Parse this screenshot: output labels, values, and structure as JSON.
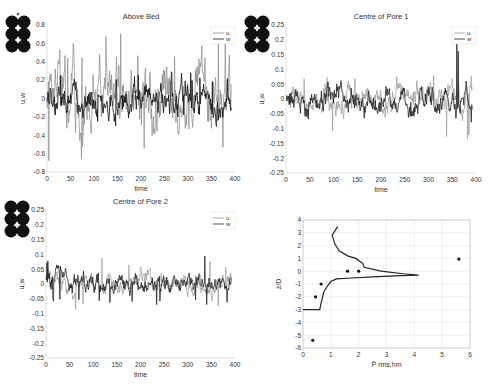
{
  "chart_data": [
    {
      "type": "line",
      "title": "Above Bed",
      "xlabel": "time",
      "ylabel": "u,w",
      "xlim": [
        0,
        400
      ],
      "ylim": [
        -0.8,
        0.8
      ],
      "xticks": [
        0,
        50,
        100,
        150,
        200,
        250,
        300,
        350,
        400
      ],
      "yticks": [
        -0.8,
        -0.6,
        -0.4,
        -0.2,
        0,
        0.2,
        0.4,
        0.6,
        0.8
      ],
      "legend": [
        "u",
        "w"
      ],
      "legend_position": "upper right",
      "series": [
        {
          "name": "u",
          "color": "#888888",
          "amplitude": 0.35,
          "peak": 0.72,
          "trough": -0.76,
          "seed": 3
        },
        {
          "name": "w",
          "color": "#111111",
          "amplitude": 0.15,
          "peak": 0.3,
          "trough": -0.25,
          "seed": 7
        }
      ],
      "inset_marker": "top"
    },
    {
      "type": "line",
      "title": "Centre of Pore 1",
      "xlabel": "time",
      "ylabel": "u,w",
      "xlim": [
        0,
        400
      ],
      "ylim": [
        -0.25,
        0.25
      ],
      "xticks": [
        0,
        50,
        100,
        150,
        200,
        250,
        300,
        350,
        400
      ],
      "yticks": [
        -0.25,
        -0.2,
        -0.15,
        -0.1,
        -0.05,
        0,
        0.05,
        0.1,
        0.15,
        0.2,
        0.25
      ],
      "legend": [
        "u",
        "w"
      ],
      "legend_position": "upper right",
      "series": [
        {
          "name": "u",
          "color": "#999999",
          "amplitude": 0.04,
          "peak": 0.08,
          "trough": -0.15,
          "seed": 11
        },
        {
          "name": "w",
          "color": "#222222",
          "amplitude": 0.04,
          "peak": 0.25,
          "trough": -0.08,
          "seed": 19
        }
      ],
      "inset_marker": "centre-1"
    },
    {
      "type": "line",
      "title": "Centre of Pore 2",
      "xlabel": "time",
      "ylabel": "u,w",
      "xlim": [
        0,
        400
      ],
      "ylim": [
        -0.25,
        0.25
      ],
      "xticks": [
        0,
        50,
        100,
        150,
        200,
        250,
        300,
        350,
        400
      ],
      "yticks": [
        -0.25,
        -0.2,
        -0.15,
        -0.1,
        -0.05,
        0,
        0.05,
        0.1,
        0.15,
        0.2,
        0.25
      ],
      "legend": [
        "u",
        "w"
      ],
      "legend_position": "upper right",
      "series": [
        {
          "name": "u",
          "color": "#999999",
          "amplitude": 0.03,
          "peak": 0.09,
          "trough": -0.09,
          "seed": 23
        },
        {
          "name": "w",
          "color": "#222222",
          "amplitude": 0.03,
          "peak": 0.11,
          "trough": -0.07,
          "seed": 29
        }
      ],
      "inset_marker": "centre-2"
    },
    {
      "type": "line+scatter",
      "title": "",
      "xlabel": "P̄ rms,hm",
      "ylabel": "z/D",
      "xlim": [
        0,
        6
      ],
      "ylim": [
        -6,
        4
      ],
      "xticks": [
        0,
        1,
        2,
        3,
        4,
        5,
        6
      ],
      "yticks": [
        -6,
        -5,
        -4,
        -3,
        -2,
        -1,
        0,
        1,
        2,
        3,
        4
      ],
      "grid": true,
      "line": {
        "x": [
          0,
          0.6,
          0.65,
          0.75,
          0.9,
          1.0,
          1.2,
          1.6,
          2.5,
          3.5,
          4.15,
          3.6,
          2.8,
          2.2,
          2.15,
          1.9,
          1.6,
          1.3,
          1.15,
          1.05,
          1.1,
          1.25
        ],
        "y": [
          -3,
          -3,
          -2.5,
          -1.6,
          -1.1,
          -0.8,
          -0.6,
          -0.55,
          -0.45,
          -0.35,
          -0.3,
          -0.2,
          0,
          0.3,
          0.6,
          1.0,
          1.2,
          1.6,
          2.1,
          2.8,
          3.0,
          3.5
        ]
      },
      "points": {
        "x": [
          0.35,
          0.45,
          0.65,
          1.6,
          2.0,
          5.6
        ],
        "y": [
          -5.4,
          -2.0,
          -1.0,
          0,
          0,
          0.95
        ]
      }
    }
  ]
}
